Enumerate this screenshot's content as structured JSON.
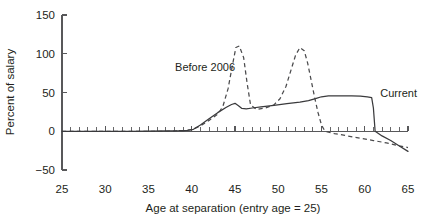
{
  "chart_data": {
    "type": "line",
    "title": "",
    "xlabel": "Age at separation (entry age = 25)",
    "ylabel": "Percent of salary",
    "xlim": [
      25,
      65
    ],
    "ylim": [
      -50,
      150
    ],
    "xticks": [
      25,
      30,
      35,
      40,
      45,
      50,
      55,
      60,
      65
    ],
    "xtick_labels": [
      "25",
      "30",
      "35",
      "40",
      "45",
      "50",
      "55",
      "60",
      "65"
    ],
    "yticks": [
      -50,
      0,
      50,
      100,
      150
    ],
    "ytick_labels": [
      "−50",
      "0",
      "50",
      "100",
      "150"
    ],
    "minor_xtick_step": 1,
    "grid": false,
    "legend_position": "inline-annotation",
    "series": [
      {
        "name": "Before 2006",
        "style": "dashed",
        "label_text": "Before 2006",
        "label_x": 45.0,
        "label_y": 78,
        "x": [
          25,
          28,
          31,
          34,
          37,
          39,
          40,
          41,
          42,
          43,
          43.6,
          44.2,
          44.7,
          45.1,
          45.5,
          46.0,
          46.4,
          46.8,
          47.5,
          48.5,
          49.5,
          50.2,
          50.9,
          51.5,
          52.0,
          52.5,
          53.0,
          53.4,
          53.8,
          54.2,
          54.6,
          55.0,
          55.4,
          56.5,
          58.0,
          59.5,
          61.0,
          62.5,
          64.0,
          65.0
        ],
        "y": [
          0,
          0,
          0,
          0,
          0,
          0.5,
          2,
          7,
          14,
          22,
          32,
          55,
          85,
          108,
          110,
          95,
          62,
          34,
          28,
          30,
          34,
          42,
          58,
          80,
          98,
          108,
          104,
          88,
          66,
          44,
          24,
          8,
          0,
          -3,
          -6,
          -9,
          -12,
          -15,
          -19,
          -21
        ]
      },
      {
        "name": "Current",
        "style": "solid",
        "label_text": "Current",
        "label_x": 61.8,
        "label_y": 44,
        "x": [
          25,
          28,
          31,
          33,
          35,
          37,
          38.5,
          39.5,
          40.2,
          41,
          42,
          43,
          44,
          44.6,
          45.0,
          45.4,
          45.8,
          46.3,
          47,
          48,
          49.5,
          51,
          52.5,
          53.5,
          54.3,
          55.0,
          55.8,
          56.5,
          57.5,
          58.5,
          59.5,
          60.3,
          60.8,
          61.0,
          61.2,
          62.0,
          63.0,
          64.0,
          65.0
        ],
        "y": [
          0,
          0,
          0,
          0,
          0.3,
          0.6,
          0.8,
          1.2,
          2.5,
          8,
          16,
          24,
          31,
          34.5,
          36,
          33,
          29.5,
          29,
          30,
          31.5,
          33.5,
          35.5,
          37.5,
          39.5,
          42,
          44.5,
          45.5,
          45.8,
          45.8,
          45.5,
          45.2,
          44.5,
          43.5,
          30,
          0,
          -6,
          -12,
          -19,
          -26
        ]
      }
    ]
  }
}
